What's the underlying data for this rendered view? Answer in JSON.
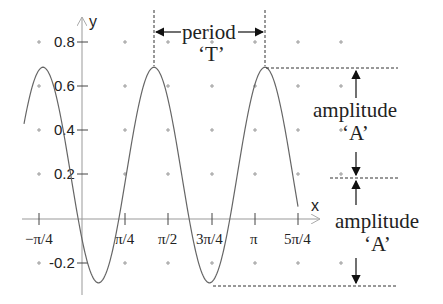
{
  "chart_data": {
    "type": "line",
    "title": "",
    "xlabel": "x",
    "ylabel": "y",
    "x_ticks": [
      "−π/4",
      "π/4",
      "π/2",
      "3π/4",
      "π",
      "5π/4"
    ],
    "y_ticks": [
      "0.8",
      "0.6",
      "0.4",
      "0.2",
      "-0.2"
    ],
    "grid": "plus-markers",
    "series": [
      {
        "name": "y = 0.2 + 0.49·sin(πx − c)",
        "midline": 0.2,
        "amplitude": 0.49,
        "max": 0.69,
        "min": -0.29,
        "x_range": [
          "−0.95",
          "3.98"
        ],
        "peaks_x": [
          "≈ −0.72",
          "≈ 1.33",
          "≈ 3.36"
        ]
      }
    ],
    "annotations": {
      "period_label": "period",
      "period_symbol": "‘T’",
      "amplitude_label_1": "amplitude",
      "amplitude_symbol_1": "‘A’",
      "amplitude_label_2": "amplitude",
      "amplitude_symbol_2": "‘A’"
    }
  }
}
